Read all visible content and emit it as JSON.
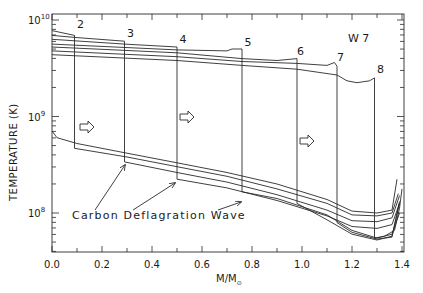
{
  "chart_data": {
    "type": "line",
    "title": "W 7",
    "xlabel": "M/M⊙",
    "ylabel": "TEMPERATURE (K)",
    "xscale": "linear",
    "yscale": "log",
    "xlim": [
      0.0,
      1.4
    ],
    "ylim_log10": [
      7.6,
      10.04
    ],
    "x_ticks": [
      0.0,
      0.2,
      0.4,
      0.6,
      0.8,
      1.0,
      1.2,
      1.4
    ],
    "x_tick_labels": [
      "0.0",
      "0.2",
      "0.4",
      "0.6",
      "0.8",
      "1.0",
      "1.2",
      "1.4"
    ],
    "y_ticks_log10": [
      8,
      9,
      10
    ],
    "y_tick_labels": [
      {
        "base": "10",
        "exp": "8"
      },
      {
        "base": "10",
        "exp": "9"
      },
      {
        "base": "10",
        "exp": "10"
      }
    ],
    "grid": false,
    "annotation": "Carbon Deflagration Wave",
    "direction_arrows_x": [
      0.12,
      0.52,
      1.0
    ],
    "curves": [
      {
        "label": "1",
        "front": 0.0,
        "pre_log10": [],
        "post": [
          [
            0.0,
            8.85
          ],
          [
            0.02,
            8.78
          ],
          [
            0.1,
            8.72
          ],
          [
            0.3,
            8.62
          ],
          [
            0.5,
            8.52
          ],
          [
            0.7,
            8.42
          ],
          [
            0.9,
            8.3
          ],
          [
            1.1,
            8.14
          ],
          [
            1.2,
            8.02
          ],
          [
            1.3,
            8.0
          ],
          [
            1.36,
            8.03
          ],
          [
            1.38,
            8.35
          ]
        ]
      },
      {
        "label": "2",
        "front": 0.09,
        "pre": [
          [
            0.0,
            9.89
          ],
          [
            0.09,
            9.84
          ]
        ],
        "post": [
          [
            0.09,
            8.67
          ],
          [
            0.3,
            8.58
          ],
          [
            0.5,
            8.48
          ],
          [
            0.7,
            8.38
          ],
          [
            0.9,
            8.25
          ],
          [
            1.1,
            8.1
          ],
          [
            1.2,
            7.98
          ],
          [
            1.3,
            7.97
          ],
          [
            1.36,
            8.0
          ],
          [
            1.385,
            8.2
          ]
        ]
      },
      {
        "label": "3",
        "front": 0.29,
        "pre": [
          [
            0.0,
            9.84
          ],
          [
            0.09,
            9.82
          ],
          [
            0.29,
            9.78
          ]
        ],
        "post": [
          [
            0.29,
            8.53
          ],
          [
            0.5,
            8.42
          ],
          [
            0.7,
            8.32
          ],
          [
            0.9,
            8.19
          ],
          [
            1.1,
            8.03
          ],
          [
            1.2,
            7.92
          ],
          [
            1.3,
            7.91
          ],
          [
            1.36,
            7.95
          ],
          [
            1.39,
            8.18
          ]
        ]
      },
      {
        "label": "4",
        "front": 0.5,
        "pre": [
          [
            0.0,
            9.8
          ],
          [
            0.29,
            9.75
          ],
          [
            0.5,
            9.72
          ]
        ],
        "post": [
          [
            0.5,
            8.35
          ],
          [
            0.7,
            8.26
          ],
          [
            0.9,
            8.13
          ],
          [
            1.1,
            7.97
          ],
          [
            1.2,
            7.86
          ],
          [
            1.3,
            7.84
          ],
          [
            1.36,
            7.88
          ],
          [
            1.39,
            8.1
          ]
        ]
      },
      {
        "label": "5",
        "front": 0.76,
        "pre": [
          [
            0.0,
            9.75
          ],
          [
            0.5,
            9.69
          ],
          [
            0.7,
            9.68
          ],
          [
            0.72,
            9.7
          ],
          [
            0.76,
            9.7
          ]
        ],
        "post": [
          [
            0.76,
            8.22
          ],
          [
            0.9,
            8.15
          ],
          [
            1.1,
            7.98
          ],
          [
            1.2,
            7.82
          ],
          [
            1.3,
            7.74
          ],
          [
            1.36,
            7.78
          ],
          [
            1.39,
            8.0
          ]
        ]
      },
      {
        "label": "6",
        "front": 0.98,
        "pre": [
          [
            0.0,
            9.72
          ],
          [
            0.5,
            9.66
          ],
          [
            0.76,
            9.6
          ],
          [
            0.9,
            9.58
          ],
          [
            0.98,
            9.6
          ]
        ],
        "post": [
          [
            0.98,
            8.1
          ],
          [
            1.1,
            7.93
          ],
          [
            1.2,
            7.78
          ],
          [
            1.3,
            7.72
          ],
          [
            1.36,
            7.76
          ],
          [
            1.39,
            8.12
          ]
        ]
      },
      {
        "label": "7",
        "front": 1.14,
        "pre": [
          [
            0.0,
            9.68
          ],
          [
            0.5,
            9.62
          ],
          [
            0.76,
            9.57
          ],
          [
            0.98,
            9.55
          ],
          [
            1.1,
            9.53
          ],
          [
            1.13,
            9.56
          ],
          [
            1.14,
            9.52
          ]
        ],
        "post": [
          [
            1.14,
            7.9
          ],
          [
            1.2,
            7.8
          ],
          [
            1.3,
            7.73
          ],
          [
            1.36,
            7.75
          ],
          [
            1.39,
            8.1
          ]
        ]
      },
      {
        "label": "8",
        "front": 1.29,
        "pre": [
          [
            0.0,
            9.64
          ],
          [
            0.5,
            9.58
          ],
          [
            0.76,
            9.53
          ],
          [
            0.98,
            9.49
          ],
          [
            1.14,
            9.43
          ],
          [
            1.18,
            9.37
          ],
          [
            1.22,
            9.35
          ],
          [
            1.27,
            9.37
          ],
          [
            1.29,
            9.4
          ]
        ],
        "post": [
          [
            1.29,
            7.74
          ],
          [
            1.33,
            7.76
          ],
          [
            1.37,
            7.82
          ],
          [
            1.39,
            8.05
          ],
          [
            1.4,
            8.25
          ]
        ]
      }
    ],
    "curve_label_positions": [
      {
        "label": "2",
        "x": 0.1,
        "log10": 9.92
      },
      {
        "label": "3",
        "x": 0.3,
        "log10": 9.82
      },
      {
        "label": "4",
        "x": 0.51,
        "log10": 9.76
      },
      {
        "label": "5",
        "x": 0.77,
        "log10": 9.73
      },
      {
        "label": "6",
        "x": 0.98,
        "log10": 9.64
      },
      {
        "label": "7",
        "x": 1.14,
        "log10": 9.58
      },
      {
        "label": "8",
        "x": 1.3,
        "log10": 9.45
      }
    ]
  },
  "labels": {
    "title": "W 7",
    "xlabel_main": "M/M",
    "xlabel_sub": "⊙",
    "ylabel": "TEMPERATURE (K)",
    "annotation": "Carbon Deflagration Wave"
  }
}
